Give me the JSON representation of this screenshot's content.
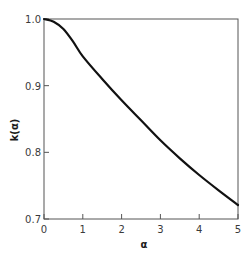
{
  "chart_data": {
    "type": "line",
    "title": "",
    "xlabel": "α",
    "ylabel": "k(α)",
    "xlim": [
      0,
      5
    ],
    "ylim": [
      0.7,
      1.0
    ],
    "grid": false,
    "legend": null,
    "x_ticks": [
      "0",
      "1",
      "2",
      "3",
      "4",
      "5"
    ],
    "y_ticks": [
      "0.7",
      "0.8",
      "0.9",
      "1.0"
    ],
    "series": [
      {
        "name": "k(α)",
        "color": "#111111",
        "x": [
          0,
          0.25,
          0.5,
          0.75,
          1.0,
          1.5,
          2.0,
          2.5,
          3.0,
          3.5,
          4.0,
          4.5,
          5.0
        ],
        "y": [
          1.0,
          0.996,
          0.985,
          0.966,
          0.944,
          0.91,
          0.878,
          0.848,
          0.818,
          0.791,
          0.766,
          0.743,
          0.721
        ]
      }
    ]
  },
  "axes": {
    "x_label": "α",
    "y_label": "k(α)",
    "x_tick_labels": [
      "0",
      "1",
      "2",
      "3",
      "4",
      "5"
    ],
    "y_tick_labels": [
      "0.7",
      "0.8",
      "0.9",
      "1.0"
    ]
  }
}
